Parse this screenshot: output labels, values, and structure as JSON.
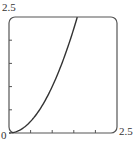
{
  "chart_data": {
    "type": "line",
    "title": "",
    "xlabel": "",
    "ylabel": "",
    "xlim": [
      0,
      2.5
    ],
    "ylim": [
      0,
      2.5
    ],
    "x_tick_labels": [
      "0",
      "2.5"
    ],
    "y_tick_labels": [
      "2.5"
    ],
    "x_ticks": [
      0.5,
      1.0,
      1.5,
      2.0
    ],
    "y_ticks": [
      0.5,
      1.0,
      1.5,
      2.0
    ],
    "grid": false,
    "series": [
      {
        "name": "curve",
        "x": [
          0,
          0.2,
          0.4,
          0.6,
          0.8,
          1.0,
          1.2,
          1.4,
          1.58
        ],
        "y": [
          0,
          0.04,
          0.16,
          0.36,
          0.64,
          1.0,
          1.44,
          1.96,
          2.5
        ]
      }
    ]
  },
  "labels": {
    "origin": "0",
    "x_max": "2.5",
    "y_max": "2.5"
  }
}
